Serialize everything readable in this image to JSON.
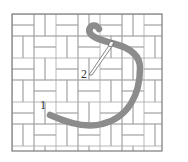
{
  "diagram": {
    "labels": {
      "point_1": "1",
      "point_2": "2"
    },
    "colors": {
      "background": "#ffffff",
      "grid_line": "#9a9a9a",
      "frame": "#7a7a7a",
      "thread": "#8c8c8c",
      "needle": "#666666"
    }
  }
}
